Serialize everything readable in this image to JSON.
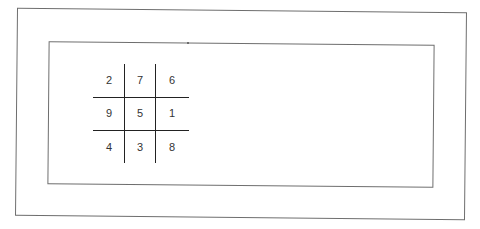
{
  "diagram": {
    "type": "magic-square-grid",
    "rows": [
      [
        "2",
        "7",
        "6"
      ],
      [
        "9",
        "5",
        "1"
      ],
      [
        "4",
        "3",
        "8"
      ]
    ],
    "colors": {
      "frame": "#6e6e6e",
      "grid_lines": "#222222",
      "text": "#333333",
      "background": "#ffffff"
    }
  }
}
